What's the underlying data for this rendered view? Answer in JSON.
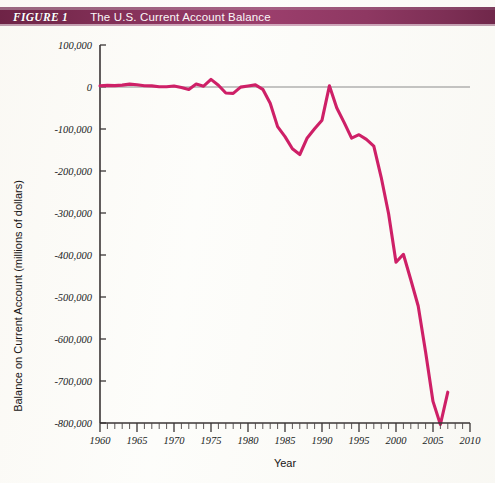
{
  "header": {
    "figure_label": "FIGURE 1",
    "title": "The U.S. Current Account Balance",
    "bar_color": "#8d3560",
    "text_color": "#ffffff"
  },
  "chart_data": {
    "type": "line",
    "title": "The U.S. Current Account Balance",
    "xlabel": "Year",
    "ylabel": "Balance on Current Account (millions of dollars)",
    "xlim": [
      1960,
      2010
    ],
    "ylim": [
      -800000,
      100000
    ],
    "x_tick_labels": [
      "1960",
      "1965",
      "1970",
      "1975",
      "1980",
      "1985",
      "1990",
      "1995",
      "2000",
      "2005",
      "2010"
    ],
    "x_ticks": [
      1960,
      1965,
      1970,
      1975,
      1980,
      1985,
      1990,
      1995,
      2000,
      2005,
      2010
    ],
    "x_minor_tick_step": 1,
    "y_tick_labels": [
      "100,000",
      "0",
      "-100,000",
      "-200,000",
      "-300,000",
      "-400,000",
      "-500,000",
      "-600,000",
      "-700,000",
      "-800,000"
    ],
    "y_ticks": [
      100000,
      0,
      -100000,
      -200000,
      -300000,
      -400000,
      -500000,
      -600000,
      -700000,
      -800000
    ],
    "grid": false,
    "legend": null,
    "series": [
      {
        "name": "Balance on Current Account",
        "color": "#ce2067",
        "x": [
          1960,
          1961,
          1962,
          1963,
          1964,
          1965,
          1966,
          1967,
          1968,
          1969,
          1970,
          1971,
          1972,
          1973,
          1974,
          1975,
          1976,
          1977,
          1978,
          1979,
          1980,
          1981,
          1982,
          1983,
          1984,
          1985,
          1986,
          1987,
          1988,
          1989,
          1990,
          1991,
          1992,
          1993,
          1994,
          1995,
          1996,
          1997,
          1998,
          1999,
          2000,
          2001,
          2002,
          2003,
          2004,
          2005,
          2006,
          2007
        ],
        "values": [
          2824,
          3822,
          3387,
          4414,
          6823,
          5431,
          3031,
          2583,
          611,
          399,
          2331,
          -1433,
          -5795,
          7140,
          1962,
          18116,
          4295,
          -14335,
          -15143,
          -285,
          2317,
          5030,
          -5536,
          -38691,
          -94344,
          -118155,
          -147177,
          -160655,
          -121153,
          -99486,
          -78969,
          2895,
          -50078,
          -84806,
          -121612,
          -113567,
          -124764,
          -140726,
          -215062,
          -301630,
          -417426,
          -398270,
          -459151,
          -521519,
          -631130,
          -748683,
          -803547,
          -726573
        ]
      }
    ],
    "annotations": [
      {
        "text": "zero reference line",
        "y": 0
      }
    ]
  }
}
